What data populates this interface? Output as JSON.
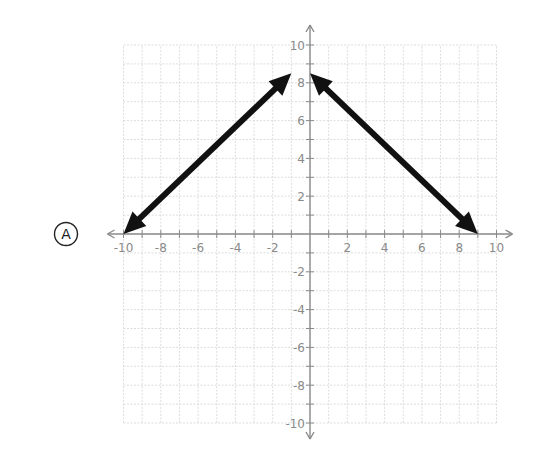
{
  "choice": {
    "letter": "A"
  },
  "chart_data": {
    "type": "line",
    "title": "",
    "xlabel": "",
    "ylabel": "",
    "xlim": [
      -10,
      10
    ],
    "ylim": [
      -10,
      10
    ],
    "grid": true,
    "grid_step": 1,
    "x_ticks": [
      -10,
      -8,
      -6,
      -4,
      -2,
      2,
      4,
      6,
      8,
      10
    ],
    "y_ticks": [
      -10,
      -8,
      -6,
      -4,
      -2,
      2,
      4,
      6,
      8,
      10
    ],
    "x_tick_labels": [
      "-10",
      "-8",
      "-6",
      "-4",
      "-2",
      "2",
      "4",
      "6",
      "8",
      "10"
    ],
    "y_tick_labels": [
      "-10",
      "-8",
      "-6",
      "-4",
      "-2",
      "2",
      "4",
      "6",
      "8",
      "10"
    ],
    "series": [
      {
        "name": "left-segment",
        "points": [
          [
            -10,
            0
          ],
          [
            -1,
            8.5
          ]
        ],
        "arrows": "both"
      },
      {
        "name": "right-segment",
        "points": [
          [
            0,
            8.5
          ],
          [
            9,
            0
          ]
        ],
        "arrows": "both"
      }
    ],
    "colors": {
      "line": "#111111",
      "grid": "#d4d4d4",
      "axis": "#8a8a8a",
      "tick_label": "#8a8a8a"
    }
  }
}
